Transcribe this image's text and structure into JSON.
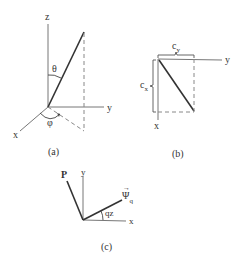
{
  "panels": {
    "a": {
      "caption": "(a)",
      "axes": {
        "z": "z",
        "y": "y",
        "x": "x"
      },
      "angles": {
        "polar": "θ",
        "azimuth": "φ"
      }
    },
    "b": {
      "caption": "(b)",
      "axes": {
        "y": "y",
        "x": "x"
      },
      "components": {
        "top": "c",
        "top_sub": "y",
        "left": "c",
        "left_sub": "x"
      }
    },
    "c": {
      "caption": "(c)",
      "axes": {
        "y": "y",
        "x": "x"
      },
      "vectors": {
        "p": "P",
        "psi": "Ψ",
        "psi_sub": "q",
        "psi_arrow": "→"
      },
      "angle": "qz"
    }
  },
  "colors": {
    "line": "#555555",
    "rod": "#333333",
    "dash": "#777777",
    "background": "#ffffff"
  }
}
